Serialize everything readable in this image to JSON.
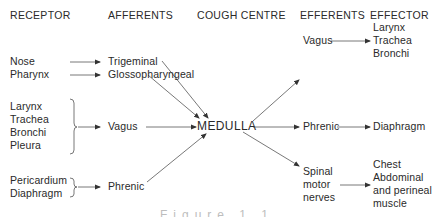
{
  "headers": {
    "receptor": "RECEPTOR",
    "afferents": "AFFERENTS",
    "cough_centre": "COUGH CENTRE",
    "efferents": "EFFERENTS",
    "effector": "EFFECTOR"
  },
  "receptors": {
    "group1": [
      "Nose",
      "Pharynx"
    ],
    "group2": [
      "Larynx",
      "Trachea",
      "Bronchi",
      "Pleura"
    ],
    "group3": [
      "Pericardium",
      "Diaphragm"
    ]
  },
  "afferents": {
    "trigeminal": "Trigeminal",
    "glossopharyngeal": "Glossopharyngeal",
    "vagus": "Vagus",
    "phrenic": "Phrenic"
  },
  "centre": {
    "label": "MEDULLA"
  },
  "efferents": {
    "vagus": "Vagus",
    "phrenic": "Phrenic",
    "spinal": [
      "Spinal",
      "motor",
      "nerves"
    ]
  },
  "effectors": {
    "vagus_targets": [
      "Larynx",
      "Trachea",
      "Bronchi"
    ],
    "phrenic_target": "Diaphragm",
    "spinal_targets": [
      "Chest",
      "Abdominal",
      "and perineal",
      "muscle"
    ]
  },
  "caption": {
    "text": "Figure 1.1 Cough reflex"
  },
  "colors": {
    "ink": "#2a2a2a",
    "line": "#555555",
    "background": "#ffffff"
  }
}
